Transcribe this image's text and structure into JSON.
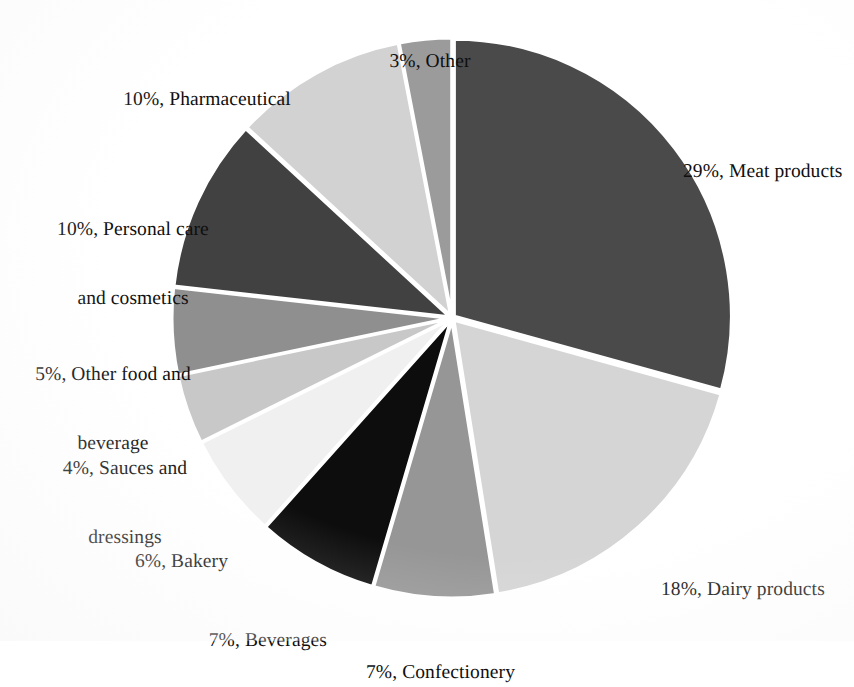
{
  "chart_data": {
    "type": "pie",
    "title": "",
    "subtitle": "",
    "xlabel": "",
    "ylabel": "",
    "legend_position": "outside-labels",
    "grid": false,
    "start_angle_deg": 0,
    "direction": "clockwise",
    "value_unit": "%",
    "categories": [
      "Meat products",
      "Dairy products",
      "Confectionery",
      "Beverages",
      "Bakery",
      "Sauces and dressings",
      "Other food and beverage",
      "Personal care and cosmetics",
      "Pharmaceutical",
      "Other"
    ],
    "values": [
      29,
      18,
      7,
      7,
      6,
      4,
      5,
      10,
      10,
      3
    ],
    "colors": [
      "#4a4a4a",
      "#d5d5d5",
      "#969696",
      "#0d0d0d",
      "#f0f0f0",
      "#c8c8c8",
      "#8f8f8f",
      "#414141",
      "#d2d2d2",
      "#9b9b9b"
    ],
    "slices": [
      {
        "label": "29%, Meat products",
        "category": "Meat products",
        "value": 29,
        "color": "#4a4a4a",
        "label_lines": [
          "29%, Meat products"
        ]
      },
      {
        "label": "18%, Dairy products",
        "category": "Dairy products",
        "value": 18,
        "color": "#d5d5d5",
        "label_lines": [
          "18%, Dairy products"
        ]
      },
      {
        "label": "7%, Confectionery",
        "category": "Confectionery",
        "value": 7,
        "color": "#969696",
        "label_lines": [
          "7%, Confectionery"
        ]
      },
      {
        "label": "7%, Beverages",
        "category": "Beverages",
        "value": 7,
        "color": "#0d0d0d",
        "label_lines": [
          "7%, Beverages"
        ]
      },
      {
        "label": "6%, Bakery",
        "category": "Bakery",
        "value": 6,
        "color": "#f0f0f0",
        "label_lines": [
          "6%, Bakery"
        ]
      },
      {
        "label": "4%, Sauces and dressings",
        "category": "Sauces and dressings",
        "value": 4,
        "color": "#c8c8c8",
        "label_lines": [
          "4%, Sauces and",
          "dressings"
        ]
      },
      {
        "label": "5%, Other food and beverage",
        "category": "Other food and beverage",
        "value": 5,
        "color": "#8f8f8f",
        "label_lines": [
          "5%, Other food and",
          "beverage"
        ]
      },
      {
        "label": "10%, Personal care and cosmetics",
        "category": "Personal care and cosmetics",
        "value": 10,
        "color": "#414141",
        "label_lines": [
          "10%, Personal care",
          "and cosmetics"
        ]
      },
      {
        "label": "10%, Pharmaceutical",
        "category": "Pharmaceutical",
        "value": 10,
        "color": "#d2d2d2",
        "label_lines": [
          "10%, Pharmaceutical"
        ]
      },
      {
        "label": "3%, Other",
        "category": "Other",
        "value": 3,
        "color": "#9b9b9b",
        "label_lines": [
          "3%, Other"
        ]
      }
    ]
  },
  "labels": {
    "other_top": "3%, Other",
    "pharmaceutical": "10%, Pharmaceutical",
    "personal_care_l1": "10%, Personal care",
    "personal_care_l2": "and cosmetics",
    "other_food_l1": "5%, Other food and",
    "other_food_l2": "beverage",
    "sauces_l1": "4%, Sauces and",
    "sauces_l2": "dressings",
    "bakery": "6%, Bakery",
    "beverages": "7%, Beverages",
    "confectionery": "7%, Confectionery",
    "dairy": "18%, Dairy products",
    "meat": "29%, Meat products"
  },
  "geometry": {
    "center_x": 452,
    "center_y": 318,
    "radius": 277,
    "explode_offset": 3
  }
}
